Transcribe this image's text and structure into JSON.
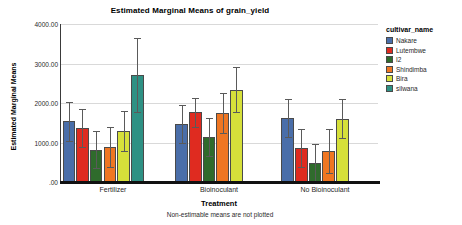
{
  "chart_data": {
    "type": "bar",
    "title": "Estimated Marginal Means of grain_yield",
    "xlabel": "Treatment",
    "ylabel": "Estimated Marginal Means",
    "footnote": "Non-estimable means are not plotted",
    "grid": true,
    "legend_position": "right",
    "legend_title": "cultivar_name",
    "ylim": [
      0,
      4000
    ],
    "ytick_labels": [
      "4000.00",
      "3000.00",
      "2000.00",
      "1000.00",
      ".00"
    ],
    "ytick_values": [
      4000,
      3000,
      2000,
      1000,
      0
    ],
    "categories": [
      "Fertilizer",
      "Bioinoculant",
      "No Bioinoculant"
    ],
    "series": [
      {
        "name": "Nakare",
        "color": "#4a6ea9",
        "values": [
          1540,
          1470,
          1620
        ],
        "err_low": [
          1050,
          980,
          1130
        ],
        "err_high": [
          2030,
          1960,
          2110
        ]
      },
      {
        "name": "Lutembwe",
        "color": "#df2b20",
        "values": [
          1360,
          1760,
          850
        ],
        "err_low": [
          880,
          1400,
          370
        ],
        "err_high": [
          1840,
          2120,
          1330
        ]
      },
      {
        "name": "I2",
        "color": "#2f6b2c",
        "values": [
          820,
          1150,
          480
        ],
        "err_low": [
          350,
          670,
          0
        ],
        "err_high": [
          1300,
          1630,
          960
        ]
      },
      {
        "name": "Shindimba",
        "color": "#ef7622",
        "values": [
          880,
          1750,
          790
        ],
        "err_low": [
          390,
          1250,
          240
        ],
        "err_high": [
          1380,
          2250,
          1340
        ]
      },
      {
        "name": "Bira",
        "color": "#d6e03a",
        "values": [
          1290,
          2340,
          1600
        ],
        "err_low": [
          790,
          1780,
          1110
        ],
        "err_high": [
          1790,
          2900,
          2090
        ]
      },
      {
        "name": "silwana",
        "color": "#2e9184",
        "values": [
          2720,
          null,
          null
        ],
        "err_low": [
          1760,
          null,
          null
        ],
        "err_high": [
          3650,
          null,
          null
        ]
      }
    ]
  }
}
